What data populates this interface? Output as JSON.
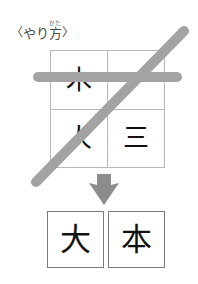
{
  "header": {
    "open_bracket": "〈",
    "close_bracket": "〉",
    "text_before_ruby": "やり",
    "ruby_base": "方",
    "ruby_text": "かた",
    "full_text": "〈やり方〉"
  },
  "grid": {
    "rows": [
      [
        {
          "char": "木",
          "struck": true
        },
        {
          "char": "一",
          "struck": true
        }
      ],
      [
        {
          "char": "人",
          "struck": true
        },
        {
          "char": "三",
          "struck": false
        }
      ]
    ],
    "border_color": "#b9b9b9"
  },
  "annotations": {
    "horizontal_bar": {
      "name": "strike-bar-horizontal",
      "color": "#a3a3a3"
    },
    "diagonal_strike": {
      "name": "strike-line-diagonal",
      "color": "#a3a3a3"
    },
    "arrow": {
      "name": "down-arrow",
      "direction": "down",
      "color": "#8c8c8c"
    }
  },
  "result": {
    "boxes": [
      {
        "char": "大"
      },
      {
        "char": "本"
      }
    ],
    "border_color": "#7d7d7d"
  }
}
